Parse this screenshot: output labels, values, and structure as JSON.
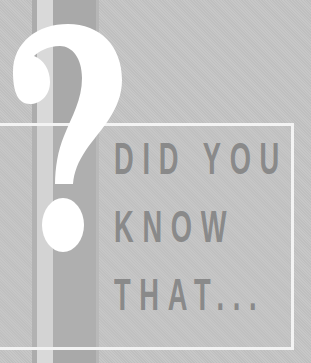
{
  "graphic": {
    "symbol": "question-mark",
    "headline": {
      "lines": [
        "DID YOU",
        "KNOW",
        "THAT..."
      ]
    },
    "colors": {
      "background": "#c5c5c5",
      "text": "#8a8a8a",
      "frame": "#f3f3f3",
      "question_mark": "#ffffff",
      "stripe_dark": "#a9a9a9",
      "stripe_light": "#d9d9d9"
    }
  }
}
